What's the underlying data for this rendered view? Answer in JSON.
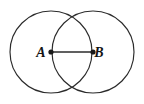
{
  "figure": {
    "background_color": "#ffffff",
    "stroke_color": "#2b2b2b",
    "label_color": "#141414",
    "dot_color": "#1a1a1a",
    "canvas": {
      "width": 144,
      "height": 104
    },
    "circles": [
      {
        "name": "left-circle",
        "cx": 51,
        "cy": 52,
        "r": 41
      },
      {
        "name": "right-circle",
        "cx": 93,
        "cy": 52,
        "r": 41
      }
    ],
    "points": [
      {
        "id": "A",
        "label": "A",
        "x": 51,
        "y": 52,
        "label_x": 41,
        "label_y": 57,
        "dot_r": 2.6
      },
      {
        "id": "B",
        "label": "B",
        "x": 93,
        "y": 52,
        "label_x": 99,
        "label_y": 57,
        "dot_r": 2.6
      }
    ],
    "segment": {
      "name": "segment-AB",
      "x1": 51,
      "y1": 52,
      "x2": 93,
      "y2": 52
    }
  }
}
